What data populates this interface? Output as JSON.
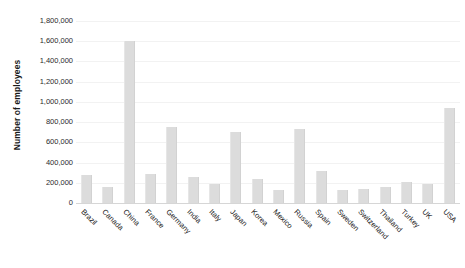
{
  "chart_data": {
    "type": "bar",
    "title": "",
    "subtitle": "",
    "xlabel": "",
    "ylabel": "Number of employees",
    "ylim": [
      0,
      1800000
    ],
    "ytick_step": 200000,
    "ytick_labels": [
      "1,800,000",
      "1,600,000",
      "1,400,000",
      "1,200,000",
      "1,000,000",
      "800,000",
      "600,000",
      "400,000",
      "200,000",
      "0"
    ],
    "ytick_values": [
      1800000,
      1600000,
      1400000,
      1200000,
      1000000,
      800000,
      600000,
      400000,
      200000,
      0
    ],
    "grid": true,
    "legend": false,
    "legend_position": "none",
    "bar_color": "#dcdcdc",
    "categories": [
      "Brazil",
      "Canada",
      "China",
      "France",
      "Germany",
      "India",
      "Italy",
      "Japan",
      "Korea",
      "Mexico",
      "Russia",
      "Spain",
      "Sweden",
      "Switzerland",
      "Thailand",
      "Turkey",
      "UK",
      "USA"
    ],
    "values": [
      280000,
      155000,
      1600000,
      290000,
      755000,
      255000,
      190000,
      705000,
      235000,
      125000,
      730000,
      315000,
      125000,
      140000,
      160000,
      205000,
      190000,
      935000
    ],
    "annotations": []
  }
}
